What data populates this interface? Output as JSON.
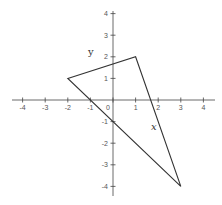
{
  "figure": {
    "title": "",
    "axes": {
      "x_label": "x",
      "y_label": "y",
      "x_range": [
        -4,
        4
      ],
      "y_range": [
        -4,
        4
      ],
      "x_ticks": [
        "-4",
        "-3",
        "-2",
        "-1",
        "0",
        "1",
        "2",
        "3",
        "4"
      ],
      "y_ticks": [
        "4",
        "3",
        "2",
        "1",
        "-1",
        "-2",
        "-3",
        "-4"
      ]
    },
    "shape": {
      "type": "triangle",
      "vertices": [
        [
          -2,
          1
        ],
        [
          1,
          2
        ],
        [
          3,
          -4
        ]
      ]
    },
    "colors": {
      "axis": "#444444",
      "shape": "#333333",
      "labels": "#555555"
    }
  }
}
